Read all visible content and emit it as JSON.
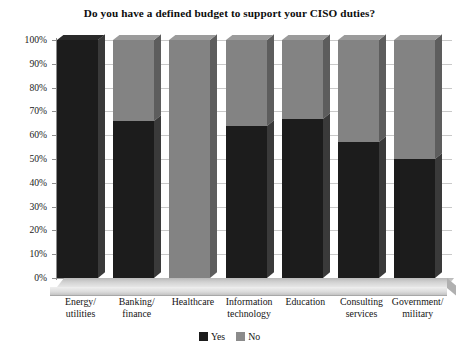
{
  "chart_data": {
    "type": "bar",
    "subtype": "stacked-100-percent-3d",
    "title": "Do you have a defined budget to support your CISO duties?",
    "xlabel": "",
    "ylabel": "",
    "ylim": [
      0,
      100
    ],
    "grid": true,
    "legend_position": "bottom-center",
    "categories": [
      "Energy/\nutilities",
      "Banking/\nfinance",
      "Healthcare",
      "Information\ntechnology",
      "Education",
      "Consulting\nservices",
      "Government/\nmilitary"
    ],
    "category_labels": [
      {
        "line1": "Energy/",
        "line2": "utilities"
      },
      {
        "line1": "Banking/",
        "line2": "finance"
      },
      {
        "line1": "Healthcare",
        "line2": ""
      },
      {
        "line1": "Information",
        "line2": "technology"
      },
      {
        "line1": "Education",
        "line2": ""
      },
      {
        "line1": "Consulting",
        "line2": "services"
      },
      {
        "line1": "Government/",
        "line2": "military"
      }
    ],
    "series": [
      {
        "name": "Yes",
        "color": "#1c1c1c",
        "values": [
          100,
          66,
          0,
          64,
          67,
          57,
          50
        ]
      },
      {
        "name": "No",
        "color": "#838383",
        "values": [
          0,
          34,
          100,
          36,
          33,
          43,
          50
        ]
      }
    ],
    "ytick_labels": [
      "100%",
      "90%",
      "80%",
      "70%",
      "60%",
      "50%",
      "40%",
      "30%",
      "20%",
      "10%",
      "0%"
    ],
    "ytick_values": [
      100,
      90,
      80,
      70,
      60,
      50,
      40,
      30,
      20,
      10,
      0
    ]
  },
  "legend": {
    "items": [
      {
        "label": "Yes",
        "color": "#1c1c1c"
      },
      {
        "label": "No",
        "color": "#838383"
      }
    ]
  }
}
